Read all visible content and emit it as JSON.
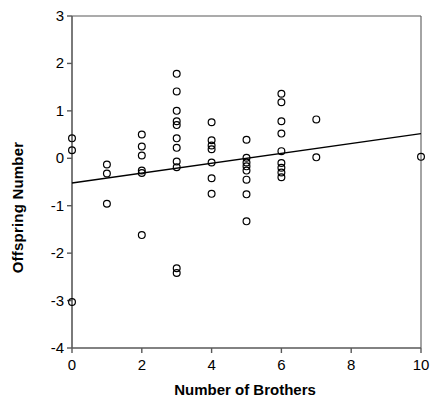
{
  "chart_data": {
    "type": "scatter",
    "title": "",
    "xlabel": "Number of Brothers",
    "ylabel": "Offspring Number",
    "xlim": [
      0,
      10
    ],
    "ylim": [
      -4,
      3
    ],
    "xticks": [
      0,
      2,
      4,
      6,
      8,
      10
    ],
    "yticks": [
      -4,
      -3,
      -2,
      -1,
      0,
      1,
      2,
      3
    ],
    "xtick_labels": [
      "0",
      "2",
      "4",
      "6",
      "8",
      "10"
    ],
    "ytick_labels": [
      "-4",
      "-3",
      "-2",
      "-1",
      "0",
      "1",
      "2",
      "3"
    ],
    "grid": false,
    "legend": null,
    "marker": "open-circle",
    "marker_color": "#000000",
    "line_color": "#000000",
    "axis_color": "#595959",
    "background_color": "#ffffff",
    "points": [
      {
        "x": 0,
        "y": 0.42
      },
      {
        "x": 0,
        "y": 0.17
      },
      {
        "x": 0,
        "y": -3.03
      },
      {
        "x": 1,
        "y": -0.13
      },
      {
        "x": 1,
        "y": -0.32
      },
      {
        "x": 1,
        "y": -0.96
      },
      {
        "x": 2,
        "y": 0.5
      },
      {
        "x": 2,
        "y": 0.25
      },
      {
        "x": 2,
        "y": 0.06
      },
      {
        "x": 2,
        "y": -0.26
      },
      {
        "x": 2,
        "y": -0.31
      },
      {
        "x": 2,
        "y": -1.62
      },
      {
        "x": 3,
        "y": 1.78
      },
      {
        "x": 3,
        "y": 1.41
      },
      {
        "x": 3,
        "y": 1.0
      },
      {
        "x": 3,
        "y": 0.78
      },
      {
        "x": 3,
        "y": 0.7
      },
      {
        "x": 3,
        "y": 0.42
      },
      {
        "x": 3,
        "y": 0.22
      },
      {
        "x": 3,
        "y": -0.07
      },
      {
        "x": 3,
        "y": -0.19
      },
      {
        "x": 3,
        "y": -2.32
      },
      {
        "x": 3,
        "y": -2.42
      },
      {
        "x": 4,
        "y": 0.76
      },
      {
        "x": 4,
        "y": 0.38
      },
      {
        "x": 4,
        "y": 0.27
      },
      {
        "x": 4,
        "y": 0.19
      },
      {
        "x": 4,
        "y": -0.09
      },
      {
        "x": 4,
        "y": -0.42
      },
      {
        "x": 4,
        "y": -0.75
      },
      {
        "x": 5,
        "y": 0.39
      },
      {
        "x": 5,
        "y": 0.01
      },
      {
        "x": 5,
        "y": -0.09
      },
      {
        "x": 5,
        "y": -0.17
      },
      {
        "x": 5,
        "y": -0.26
      },
      {
        "x": 5,
        "y": -0.45
      },
      {
        "x": 5,
        "y": -0.76
      },
      {
        "x": 5,
        "y": -1.33
      },
      {
        "x": 6,
        "y": 1.36
      },
      {
        "x": 6,
        "y": 1.18
      },
      {
        "x": 6,
        "y": 0.78
      },
      {
        "x": 6,
        "y": 0.52
      },
      {
        "x": 6,
        "y": 0.15
      },
      {
        "x": 6,
        "y": -0.1
      },
      {
        "x": 6,
        "y": -0.2
      },
      {
        "x": 6,
        "y": -0.3
      },
      {
        "x": 6,
        "y": -0.4
      },
      {
        "x": 7,
        "y": 0.82
      },
      {
        "x": 7,
        "y": 0.02
      },
      {
        "x": 10,
        "y": 0.03
      }
    ],
    "trendline": {
      "type": "linear",
      "x_start": 0,
      "y_start": -0.52,
      "x_end": 10,
      "y_end": 0.52
    }
  }
}
